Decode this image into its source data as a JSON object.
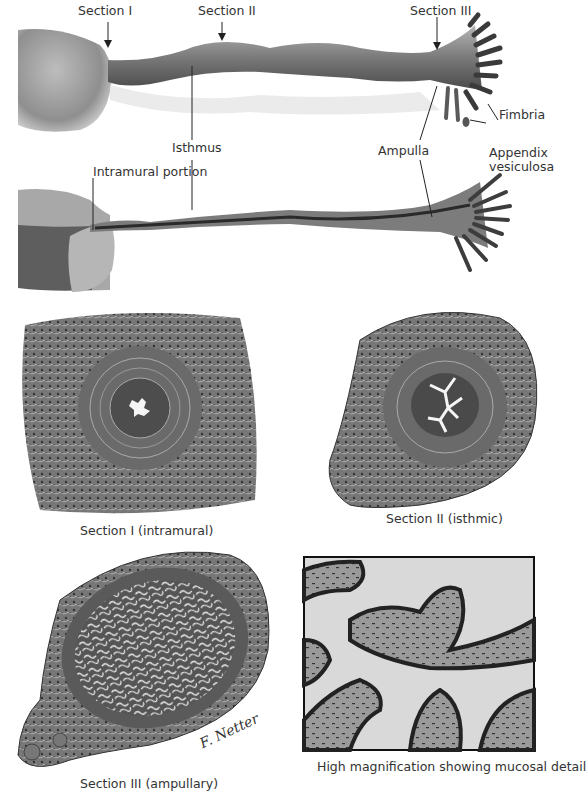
{
  "figure": {
    "type": "anatomical illustration",
    "palette": {
      "background": "#ffffff",
      "tissue_dark": "#3a3a3a",
      "tissue_mid": "#8a8a8a",
      "tissue_light": "#c8c8c8",
      "lumen": "#f4f4f4",
      "label_text": "#333333",
      "leader_line": "#222222"
    }
  },
  "labels": {
    "section_1": "Section I",
    "section_2": "Section II",
    "section_3": "Section III",
    "isthmus": "Isthmus",
    "fimbria": "Fimbria",
    "ampulla": "Ampulla",
    "appendix_line1": "Appendix",
    "appendix_line2": "vesiculosa",
    "intramural": "Intramural portion"
  },
  "captions": {
    "section_1": "Section I (intramural)",
    "section_2": "Section II (isthmic)",
    "section_3": "Section III (ampullary)",
    "high_mag": "High magnification showing mucosal detail"
  },
  "signature": "F. Netter M.D."
}
